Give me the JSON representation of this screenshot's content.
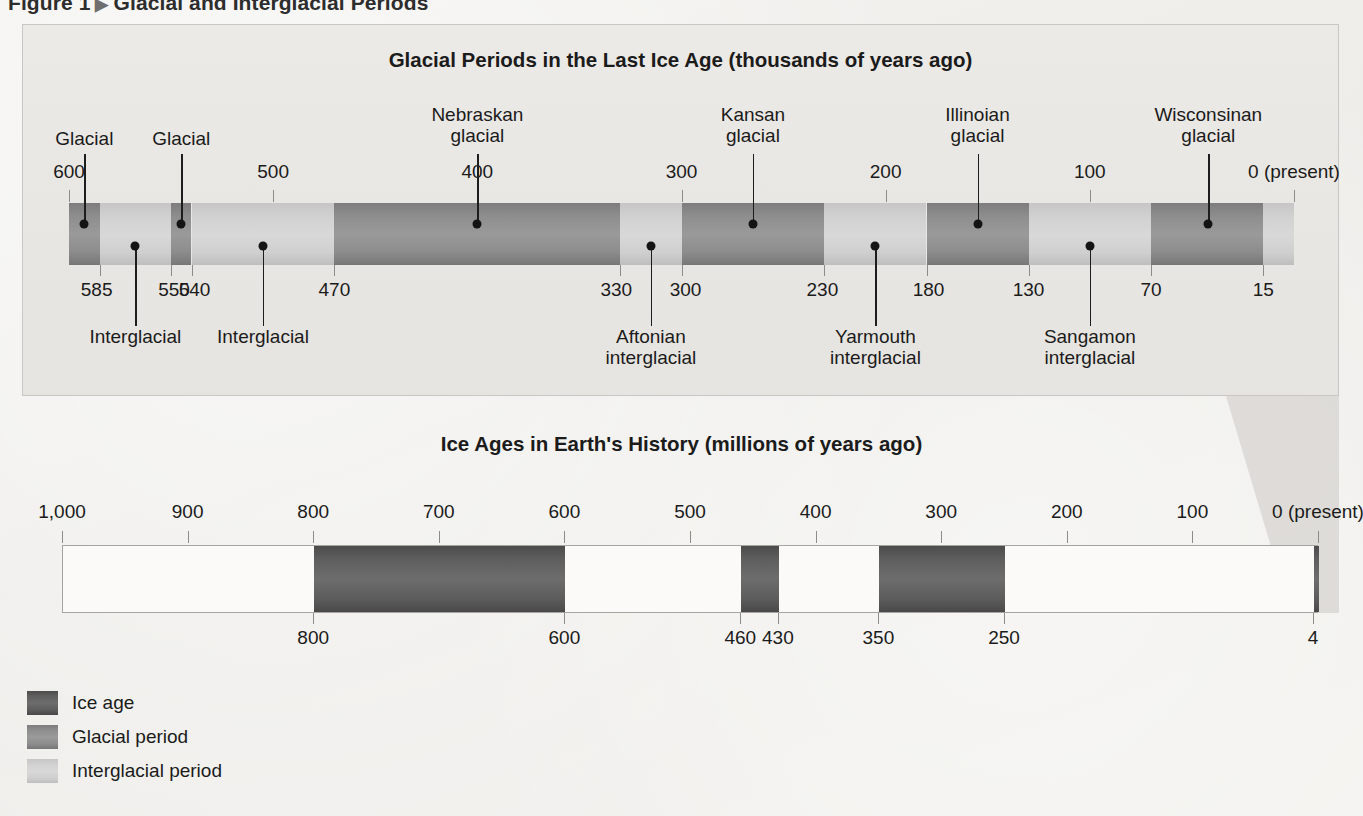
{
  "figure": {
    "number_label": "Figure 1",
    "arrow_glyph": "▶",
    "caption": "Glacial and Interglacial Periods"
  },
  "top_panel": {
    "title": "Glacial Periods in the Last Ice Age (thousands of years ago)",
    "axis_ticks_above": [
      "600",
      "500",
      "400",
      "300",
      "200",
      "100",
      "0 (present)"
    ],
    "axis_ticks_below": [
      "585",
      "550",
      "540",
      "470",
      "330",
      "300",
      "230",
      "180",
      "130",
      "70",
      "15"
    ],
    "callouts_above": [
      "Glacial",
      "Glacial",
      "Nebraskan glacial",
      "Kansan glacial",
      "Illinoian glacial",
      "Wisconsinan glacial"
    ],
    "callouts_below": [
      "Interglacial",
      "Interglacial",
      "Aftonian interglacial",
      "Yarmouth interglacial",
      "Sangamon interglacial"
    ]
  },
  "bottom_panel": {
    "title": "Ice Ages in Earth's History (millions of years ago)",
    "axis_ticks_above": [
      "1,000",
      "900",
      "800",
      "700",
      "600",
      "500",
      "400",
      "300",
      "200",
      "100",
      "0 (present)"
    ],
    "axis_ticks_below": [
      "800",
      "600",
      "460",
      "430",
      "350",
      "250",
      "4"
    ]
  },
  "legend": {
    "items": [
      {
        "label": "Ice age",
        "color": "#5e5e5e"
      },
      {
        "label": "Glacial period",
        "color": "#8e8e8e"
      },
      {
        "label": "Interglacial period",
        "color": "#d0d0d0"
      }
    ]
  },
  "colors": {
    "ice_age": "#5e5e5e",
    "glacial": "#8e8e8e",
    "interglacial": "#d0d0d0",
    "panel_background": "#e9e7e3",
    "text": "#1b1b1b"
  },
  "chart_data": {
    "type": "bar",
    "title": "Glacial and Interglacial Periods",
    "charts": [
      {
        "type": "bar",
        "title": "Glacial Periods in the Last Ice Age (thousands of years ago)",
        "xlabel": "thousands of years ago",
        "units": "thousands of years ago",
        "xlim": [
          600,
          0
        ],
        "axis_direction": "descending",
        "major_ticks": [
          600,
          500,
          400,
          300,
          200,
          100,
          0
        ],
        "major_tick_labels": [
          "600",
          "500",
          "400",
          "300",
          "200",
          "100",
          "0 (present)"
        ],
        "boundary_ticks": [
          585,
          550,
          540,
          470,
          330,
          300,
          230,
          180,
          130,
          70,
          15
        ],
        "segments": [
          {
            "name": "Glacial",
            "kind": "glacial",
            "start": 600,
            "end": 585,
            "label": "Glacial",
            "label_position": "above"
          },
          {
            "name": "Interglacial",
            "kind": "interglacial",
            "start": 585,
            "end": 550,
            "label": "Interglacial",
            "label_position": "below"
          },
          {
            "name": "Glacial",
            "kind": "glacial",
            "start": 550,
            "end": 540,
            "label": "Glacial",
            "label_position": "above"
          },
          {
            "name": "Interglacial",
            "kind": "interglacial",
            "start": 540,
            "end": 470,
            "label": "Interglacial",
            "label_position": "below"
          },
          {
            "name": "Nebraskan glacial",
            "kind": "glacial",
            "start": 470,
            "end": 330,
            "label": "Nebraskan glacial",
            "label_position": "above"
          },
          {
            "name": "Aftonian interglacial",
            "kind": "interglacial",
            "start": 330,
            "end": 300,
            "label": "Aftonian interglacial",
            "label_position": "below"
          },
          {
            "name": "Kansan glacial",
            "kind": "glacial",
            "start": 300,
            "end": 230,
            "label": "Kansan glacial",
            "label_position": "above"
          },
          {
            "name": "Yarmouth interglacial",
            "kind": "interglacial",
            "start": 230,
            "end": 180,
            "label": "Yarmouth interglacial",
            "label_position": "below"
          },
          {
            "name": "Illinoian glacial",
            "kind": "glacial",
            "start": 180,
            "end": 130,
            "label": "Illinoian glacial",
            "label_position": "above"
          },
          {
            "name": "Sangamon interglacial",
            "kind": "interglacial",
            "start": 130,
            "end": 70,
            "label": "Sangamon interglacial",
            "label_position": "below"
          },
          {
            "name": "Wisconsinan glacial",
            "kind": "glacial",
            "start": 70,
            "end": 15,
            "label": "Wisconsinan glacial",
            "label_position": "above"
          },
          {
            "name": "",
            "kind": "interglacial",
            "start": 15,
            "end": 0,
            "label": "",
            "label_position": "none"
          }
        ]
      },
      {
        "type": "bar",
        "title": "Ice Ages in Earth's History (millions of years ago)",
        "xlabel": "millions of years ago",
        "units": "millions of years ago",
        "xlim": [
          1000,
          0
        ],
        "axis_direction": "descending",
        "major_ticks": [
          1000,
          900,
          800,
          700,
          600,
          500,
          400,
          300,
          200,
          100,
          0
        ],
        "major_tick_labels": [
          "1,000",
          "900",
          "800",
          "700",
          "600",
          "500",
          "400",
          "300",
          "200",
          "100",
          "0 (present)"
        ],
        "boundary_ticks": [
          800,
          600,
          460,
          430,
          350,
          250,
          4
        ],
        "segments": [
          {
            "name": "Ice age",
            "kind": "ice_age",
            "start": 800,
            "end": 600
          },
          {
            "name": "Ice age",
            "kind": "ice_age",
            "start": 460,
            "end": 430
          },
          {
            "name": "Ice age",
            "kind": "ice_age",
            "start": 350,
            "end": 250
          },
          {
            "name": "Ice age",
            "kind": "ice_age",
            "start": 4,
            "end": 0
          }
        ]
      }
    ],
    "legend": [
      "Ice age",
      "Glacial period",
      "Interglacial period"
    ],
    "legend_position": "bottom-left"
  }
}
